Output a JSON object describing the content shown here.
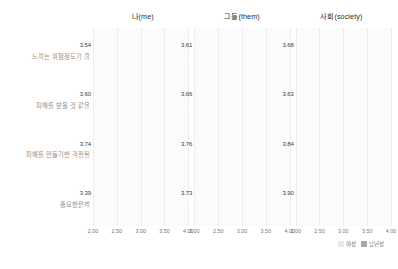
{
  "chart_data": {
    "type": "bar",
    "orientation": "horizontal",
    "title": "",
    "xlabel": "",
    "ylabel": "",
    "xlim": [
      2.0,
      4.0
    ],
    "xticks": [
      "2.00",
      "2.50",
      "3.00",
      "3.50",
      "4.00"
    ],
    "grid": true,
    "legend_position": "bottom-right",
    "panels": [
      {
        "title": "나(me)",
        "series": [
          {
            "name": "여성",
            "style": "light",
            "values": [
              3.54,
              3.6,
              3.74,
              3.39
            ]
          },
          {
            "name": "남년성",
            "style": "dark",
            "values": [
              3.53,
              3.58,
              3.69,
              3.42
            ]
          }
        ]
      },
      {
        "title": "그들(them)",
        "series": [
          {
            "name": "여성",
            "style": "light",
            "values": [
              3.61,
              3.66,
              3.76,
              3.73
            ]
          },
          {
            "name": "남년성",
            "style": "dark",
            "values": [
              3.64,
              3.63,
              3.75,
              3.65
            ]
          }
        ]
      },
      {
        "title": "사회(society)",
        "series": [
          {
            "name": "여성",
            "style": "light",
            "values": [
              3.68,
              3.63,
              3.84,
              3.9
            ]
          },
          {
            "name": "남년성",
            "style": "dark",
            "values": [
              3.65,
              3.63,
              3.75,
              3.79
            ]
          }
        ]
      }
    ],
    "categories": [
      "느끼는 위험정도가 큼",
      "피해를 받을 것 같음",
      "피해를 만들기번 걱정됨",
      "중요한문제"
    ],
    "legend": [
      {
        "label": "여성",
        "style": "light"
      },
      {
        "label": "남년성",
        "style": "dark"
      }
    ],
    "colors": {
      "light_bar": "#e9e9e9",
      "dark_bar": "#a8a8a8",
      "panel_background": "#fbfbfb",
      "gridline": "#ededed",
      "category_label": "#8e8e8e"
    }
  }
}
